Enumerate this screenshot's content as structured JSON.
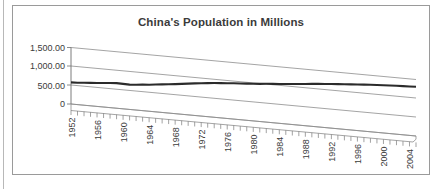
{
  "page": {
    "background": "#ffffff",
    "rule_color": "#b8b8b8",
    "frame_border_color": "#9a9a9a"
  },
  "chart_title": "China's Population in Millions",
  "chart_data": {
    "type": "line",
    "title": "China's Population in Millions",
    "xlabel": "",
    "ylabel": "",
    "ylim": [
      0,
      1500
    ],
    "ytick_labels": [
      "1,500.00",
      "1,000.00",
      "500.00",
      "0"
    ],
    "ytick_values": [
      1500,
      1000,
      500,
      0
    ],
    "grid": true,
    "legend": "none",
    "style": "3d-perspective-line",
    "line_color": "#2b2b2b",
    "gridline_color": "#8d8d8d",
    "xtick_labels": [
      "1952",
      "1956",
      "1960",
      "1964",
      "1968",
      "1972",
      "1976",
      "1980",
      "1984",
      "1988",
      "1992",
      "1996",
      "2000",
      "2004"
    ],
    "xtick_label_rotation": -90,
    "xtick_interval_years": 4,
    "minor_tick_interval_years": 1,
    "x": [
      1952,
      1953,
      1954,
      1955,
      1956,
      1957,
      1958,
      1959,
      1960,
      1961,
      1962,
      1963,
      1964,
      1965,
      1966,
      1967,
      1968,
      1969,
      1970,
      1971,
      1972,
      1973,
      1974,
      1975,
      1976,
      1977,
      1978,
      1979,
      1980,
      1981,
      1982,
      1983,
      1984,
      1985,
      1986,
      1987,
      1988,
      1989,
      1990,
      1991,
      1992,
      1993,
      1994,
      1995,
      1996,
      1997,
      1998,
      1999,
      2000,
      2001,
      2002,
      2003,
      2004,
      2005
    ],
    "series": [
      {
        "name": "China's Population in Millions",
        "values": [
          575,
          582,
          595,
          608,
          621,
          637,
          653,
          667,
          662,
          659,
          673,
          692,
          705,
          725,
          745,
          763,
          785,
          807,
          830,
          852,
          871,
          892,
          909,
          924,
          937,
          950,
          963,
          975,
          987,
          1000,
          1017,
          1030,
          1044,
          1059,
          1075,
          1093,
          1110,
          1127,
          1143,
          1158,
          1172,
          1185,
          1199,
          1211,
          1224,
          1236,
          1248,
          1258,
          1268,
          1276,
          1285,
          1292,
          1300,
          1308
        ]
      }
    ],
    "annotation": "Series rendered in receding 3D perspective; a rendering artifact produces a small peak near 1997 followed by a dip near 1999."
  },
  "geometry": {
    "note": "positions in svg units, used only by template layout"
  }
}
